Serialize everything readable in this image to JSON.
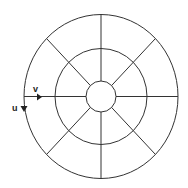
{
  "diagram": {
    "rings": 3,
    "sectors": 8,
    "line_color": "#333333",
    "background": "#ffffff",
    "axes": {
      "v_label": "v",
      "u_label": "u"
    }
  }
}
